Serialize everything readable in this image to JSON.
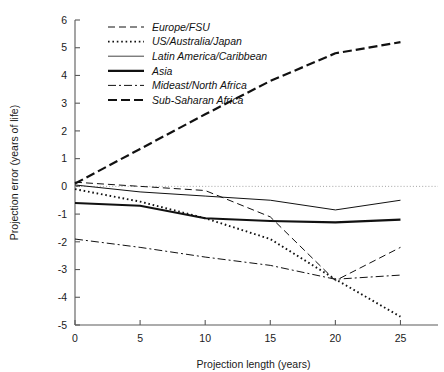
{
  "chart_data": {
    "type": "line",
    "title": "",
    "xlabel": "Projection length (years)",
    "ylabel": "Projection error (years of life)",
    "xlim": [
      0,
      26.5
    ],
    "ylim": [
      -5,
      6
    ],
    "xticks": [
      "0",
      "5",
      "10",
      "15",
      "20",
      "25"
    ],
    "yticks": [
      "6",
      "5",
      "4",
      "3",
      "2",
      "1",
      "0",
      "-1",
      "-2",
      "-3",
      "-4",
      "-5"
    ],
    "grid": false,
    "zero_reference_line": true,
    "legend_position": "top-left",
    "x": [
      0,
      5,
      10,
      15,
      20,
      25
    ],
    "series": [
      {
        "name": "Europe/FSU",
        "style": "dashed",
        "width": 1.0,
        "color": "#111111",
        "values": [
          0.15,
          0.0,
          -0.15,
          -1.1,
          -3.4,
          -2.2
        ]
      },
      {
        "name": "US/Australia/Japan",
        "style": "dotted",
        "width": 1.6,
        "color": "#111111",
        "values": [
          -0.1,
          -0.55,
          -1.15,
          -1.9,
          -3.35,
          -4.7
        ]
      },
      {
        "name": "Latin America/Caribbean",
        "style": "solid-thin",
        "width": 1.0,
        "color": "#444444",
        "values": [
          0.05,
          -0.2,
          -0.35,
          -0.5,
          -0.85,
          -0.5
        ]
      },
      {
        "name": "Asia",
        "style": "solid-thick",
        "width": 2.2,
        "color": "#111111",
        "values": [
          -0.6,
          -0.7,
          -1.15,
          -1.25,
          -1.3,
          -1.2
        ]
      },
      {
        "name": "Mideast/North Africa",
        "style": "dash-dot",
        "width": 1.0,
        "color": "#111111",
        "values": [
          -1.9,
          -2.2,
          -2.55,
          -2.85,
          -3.35,
          -3.2
        ]
      },
      {
        "name": "Sub-Saharan Africa",
        "style": "long-dash-bold",
        "width": 2.2,
        "color": "#111111",
        "values": [
          0.1,
          1.35,
          2.6,
          3.8,
          4.8,
          5.2
        ]
      }
    ]
  }
}
